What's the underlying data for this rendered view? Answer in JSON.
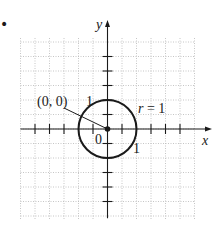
{
  "bullet": "•",
  "figure": {
    "type": "circle-on-coordinate-grid",
    "axes": {
      "x_label": "x",
      "y_label": "y",
      "origin_label": "0"
    },
    "grid": {
      "cells_left": 6,
      "cells_right": 6,
      "cells_up": 6,
      "cells_down": 6,
      "units_per_cell": 0.5
    },
    "circle": {
      "center": [
        0,
        0
      ],
      "radius": 1,
      "center_label": "(0, 0)",
      "radius_label": "r = 1"
    },
    "tick_labels": {
      "x_one": "1",
      "y_one": "1"
    },
    "colors": {
      "ink": "#1a1a1a",
      "grid": "#b8b8b8",
      "background": "#ffffff"
    }
  }
}
